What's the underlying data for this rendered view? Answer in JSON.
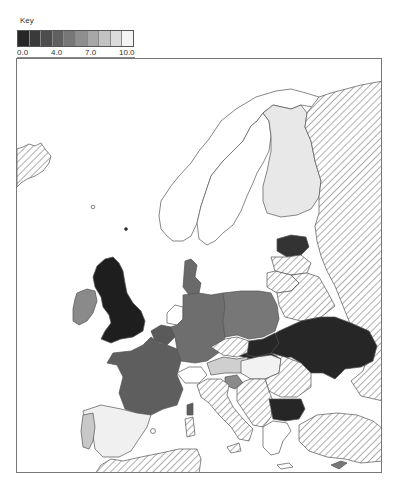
{
  "key": {
    "title": "Key",
    "labels": [
      {
        "text": "0.0",
        "pos": 0
      },
      {
        "text": "4.0",
        "pos": 40
      },
      {
        "text": "7.0",
        "pos": 70
      },
      {
        "text": "10.0",
        "pos": 100
      }
    ],
    "min": 0.0,
    "max": 10.0,
    "colors": [
      "#262626",
      "#3a3a3a",
      "#4d4d4d",
      "#606060",
      "#777777",
      "#8e8e8e",
      "#a7a7a7",
      "#c2c2c2",
      "#dcdcdc",
      "#f4f4f4"
    ],
    "no_data_pattern": "diagonal-hatch"
  },
  "map": {
    "region": "Europe",
    "countries": [
      {
        "name": "Iceland",
        "fill": "hatch"
      },
      {
        "name": "Norway",
        "fill": "#ffffff"
      },
      {
        "name": "Sweden",
        "fill": "#ffffff"
      },
      {
        "name": "Finland",
        "fill": "#e8e8e8"
      },
      {
        "name": "Russia",
        "fill": "hatch"
      },
      {
        "name": "Estonia",
        "fill": "#333333"
      },
      {
        "name": "Latvia",
        "fill": "hatch"
      },
      {
        "name": "Lithuania",
        "fill": "hatch"
      },
      {
        "name": "Belarus",
        "fill": "hatch"
      },
      {
        "name": "United Kingdom",
        "fill": "#1e1e1e"
      },
      {
        "name": "Ireland",
        "fill": "#8a8a8a"
      },
      {
        "name": "Denmark",
        "fill": "#6a6a6a"
      },
      {
        "name": "Netherlands",
        "fill": "#ffffff"
      },
      {
        "name": "Belgium",
        "fill": "#5a5a5a"
      },
      {
        "name": "Germany",
        "fill": "#6e6e6e"
      },
      {
        "name": "Poland",
        "fill": "#777777"
      },
      {
        "name": "Czech Republic",
        "fill": "hatch"
      },
      {
        "name": "Slovakia",
        "fill": "#262626"
      },
      {
        "name": "Ukraine",
        "fill": "#262626"
      },
      {
        "name": "France",
        "fill": "#5e5e5e"
      },
      {
        "name": "Switzerland",
        "fill": "#ffffff"
      },
      {
        "name": "Austria",
        "fill": "#cfcfcf"
      },
      {
        "name": "Slovenia",
        "fill": "#8a8a8a"
      },
      {
        "name": "Hungary",
        "fill": "#f2f2f2"
      },
      {
        "name": "Romania",
        "fill": "hatch"
      },
      {
        "name": "Bulgaria",
        "fill": "#262626"
      },
      {
        "name": "Italy",
        "fill": "hatch"
      },
      {
        "name": "Corsica",
        "fill": "#5e5e5e"
      },
      {
        "name": "Sardinia",
        "fill": "hatch"
      },
      {
        "name": "Balkans",
        "fill": "hatch"
      },
      {
        "name": "Greece",
        "fill": "#ffffff"
      },
      {
        "name": "Turkey",
        "fill": "hatch"
      },
      {
        "name": "Cyprus",
        "fill": "#777777"
      },
      {
        "name": "Spain",
        "fill": "#f0f0f0"
      },
      {
        "name": "Portugal",
        "fill": "#c8c8c8"
      },
      {
        "name": "North Africa",
        "fill": "hatch"
      }
    ]
  }
}
